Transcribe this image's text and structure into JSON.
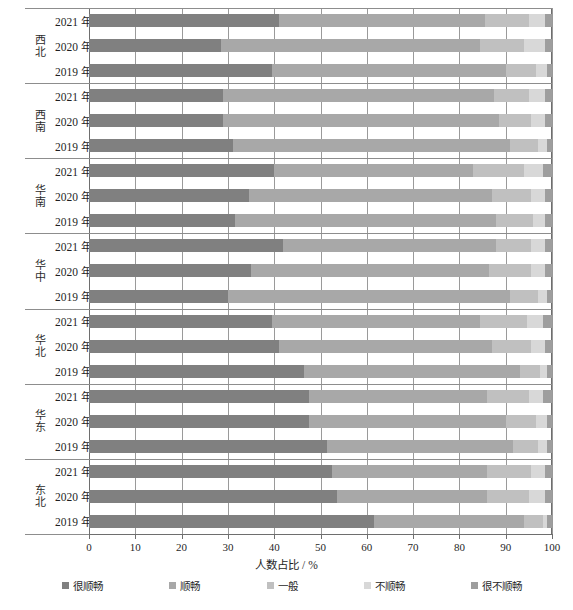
{
  "chart_data": {
    "type": "bar",
    "orientation": "horizontal",
    "stacked": true,
    "stacked_percent": true,
    "title": "",
    "xlabel": "人数占比 / %",
    "ylabel": "",
    "xlim": [
      0,
      100
    ],
    "xticks": [
      0,
      10,
      20,
      30,
      40,
      50,
      60,
      70,
      80,
      90,
      100
    ],
    "grid": true,
    "grid_axis": "x",
    "legend_position": "bottom",
    "legend": [
      "很顺畅",
      "顺畅",
      "一般",
      "不顺畅",
      "很不顺畅"
    ],
    "series_colors": [
      "#808080",
      "#a8a8a8",
      "#c0c0c0",
      "#d8d8d8",
      "#9e9e9e"
    ],
    "group_label_key": "region",
    "category_label_key": "year",
    "groups": [
      {
        "region": "西北",
        "rows": [
          {
            "year": "2021 年",
            "values": [
              41.0,
              44.5,
              9.5,
              3.5,
              1.5
            ]
          },
          {
            "year": "2020 年",
            "values": [
              28.5,
              56.0,
              9.5,
              4.5,
              1.5
            ]
          },
          {
            "year": "2019 年",
            "values": [
              39.5,
              50.5,
              6.5,
              2.5,
              1.0
            ]
          }
        ]
      },
      {
        "region": "西南",
        "rows": [
          {
            "year": "2021 年",
            "values": [
              29.0,
              58.5,
              7.5,
              3.5,
              1.5
            ]
          },
          {
            "year": "2020 年",
            "values": [
              29.0,
              59.5,
              7.0,
              3.0,
              1.5
            ]
          },
          {
            "year": "2019 年",
            "values": [
              31.0,
              60.0,
              6.0,
              2.0,
              1.0
            ]
          }
        ]
      },
      {
        "region": "华南",
        "rows": [
          {
            "year": "2021 年",
            "values": [
              40.0,
              43.0,
              11.0,
              4.0,
              2.0
            ]
          },
          {
            "year": "2020 年",
            "values": [
              34.5,
              52.5,
              8.5,
              3.0,
              1.5
            ]
          },
          {
            "year": "2019 年",
            "values": [
              31.5,
              56.5,
              8.0,
              2.5,
              1.5
            ]
          }
        ]
      },
      {
        "region": "华中",
        "rows": [
          {
            "year": "2021 年",
            "values": [
              42.0,
              46.0,
              7.5,
              3.0,
              1.5
            ]
          },
          {
            "year": "2020 年",
            "values": [
              35.0,
              51.5,
              9.0,
              3.0,
              1.5
            ]
          },
          {
            "year": "2019 年",
            "values": [
              30.0,
              61.0,
              6.0,
              2.0,
              1.0
            ]
          }
        ]
      },
      {
        "region": "华北",
        "rows": [
          {
            "year": "2021 年",
            "values": [
              39.5,
              45.0,
              10.0,
              3.5,
              2.0
            ]
          },
          {
            "year": "2020 年",
            "values": [
              41.0,
              46.0,
              8.5,
              3.0,
              1.5
            ]
          },
          {
            "year": "2019 年",
            "values": [
              46.5,
              46.5,
              4.5,
              1.5,
              1.0
            ]
          }
        ]
      },
      {
        "region": "华东",
        "rows": [
          {
            "year": "2021 年",
            "values": [
              47.5,
              38.5,
              9.0,
              3.0,
              2.0
            ]
          },
          {
            "year": "2020 年",
            "values": [
              47.5,
              42.5,
              6.5,
              2.5,
              1.0
            ]
          },
          {
            "year": "2019 年",
            "values": [
              51.5,
              40.0,
              5.5,
              2.0,
              1.0
            ]
          }
        ]
      },
      {
        "region": "东北",
        "rows": [
          {
            "year": "2021 年",
            "values": [
              52.5,
              33.5,
              9.5,
              3.0,
              1.5
            ]
          },
          {
            "year": "2020 年",
            "values": [
              53.5,
              32.5,
              9.0,
              3.5,
              1.5
            ]
          },
          {
            "year": "2019 年",
            "values": [
              61.5,
              32.5,
              4.0,
              1.0,
              1.0
            ]
          }
        ]
      }
    ]
  },
  "axis": {
    "x_title": "人数占比 / %",
    "tick_labels": [
      "0",
      "10",
      "20",
      "30",
      "40",
      "50",
      "60",
      "70",
      "80",
      "90",
      "100"
    ]
  },
  "legend": {
    "items": [
      {
        "label": "很顺畅",
        "color": "#808080"
      },
      {
        "label": "顺畅",
        "color": "#a8a8a8"
      },
      {
        "label": "一般",
        "color": "#c0c0c0"
      },
      {
        "label": "不顺畅",
        "color": "#d8d8d8"
      },
      {
        "label": "很不顺畅",
        "color": "#9e9e9e"
      }
    ]
  },
  "caption": {
    "text": ""
  }
}
